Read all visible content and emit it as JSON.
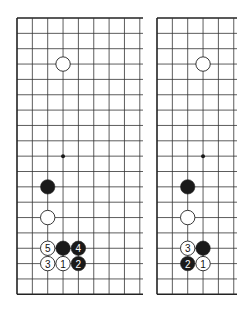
{
  "diagrams": [
    {
      "id": "left",
      "origin_x": 17,
      "origin_y": 18,
      "spacing": 15.35,
      "cols_visible": 9,
      "right_edge_x": 143,
      "rows": 19,
      "hoshi": [
        [
          3,
          9
        ]
      ],
      "stones": [
        {
          "col": 3,
          "row": 3,
          "color": "white",
          "label": ""
        },
        {
          "col": 2,
          "row": 11,
          "color": "black",
          "label": ""
        },
        {
          "col": 2,
          "row": 13,
          "color": "white",
          "label": ""
        },
        {
          "col": 2,
          "row": 15,
          "color": "white",
          "label": "5"
        },
        {
          "col": 3,
          "row": 15,
          "color": "black",
          "label": ""
        },
        {
          "col": 4,
          "row": 15,
          "color": "black",
          "label": "4"
        },
        {
          "col": 2,
          "row": 16,
          "color": "white",
          "label": "3"
        },
        {
          "col": 3,
          "row": 16,
          "color": "white",
          "label": "1"
        },
        {
          "col": 4,
          "row": 16,
          "color": "black",
          "label": "2"
        }
      ]
    },
    {
      "id": "right",
      "origin_x": 157,
      "origin_y": 18,
      "spacing": 15.35,
      "cols_visible": 6,
      "right_edge_x": 237,
      "rows": 19,
      "hoshi": [
        [
          3,
          9
        ]
      ],
      "stones": [
        {
          "col": 3,
          "row": 3,
          "color": "white",
          "label": ""
        },
        {
          "col": 2,
          "row": 11,
          "color": "black",
          "label": ""
        },
        {
          "col": 2,
          "row": 13,
          "color": "white",
          "label": ""
        },
        {
          "col": 2,
          "row": 15,
          "color": "white",
          "label": "3"
        },
        {
          "col": 3,
          "row": 15,
          "color": "black",
          "label": ""
        },
        {
          "col": 2,
          "row": 16,
          "color": "black",
          "label": "2"
        },
        {
          "col": 3,
          "row": 16,
          "color": "white",
          "label": "1"
        }
      ]
    }
  ],
  "colors": {
    "line": "#333333",
    "border": "#222222",
    "black_stone": "#1a1a1a",
    "white_stone": "#ffffff"
  }
}
